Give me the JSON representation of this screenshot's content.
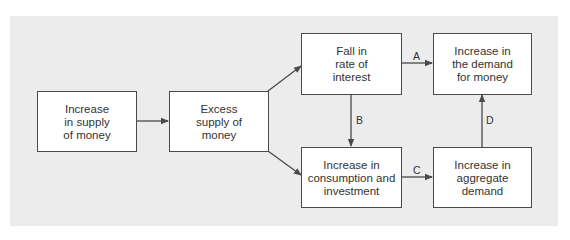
{
  "diagram": {
    "type": "flowchart",
    "colors": {
      "panel": "#ececec",
      "box_fill": "#ffffff",
      "stroke": "#4a4a4a",
      "text": "#333333"
    },
    "nodes": [
      {
        "id": "n1",
        "lines": [
          "Increase",
          "in supply",
          "of money"
        ]
      },
      {
        "id": "n2",
        "lines": [
          "Excess",
          "supply of",
          "money"
        ]
      },
      {
        "id": "n3",
        "lines": [
          "Fall in",
          "rate of",
          "interest"
        ]
      },
      {
        "id": "n4",
        "lines": [
          "Increase in",
          "the demand",
          "for money"
        ]
      },
      {
        "id": "n5",
        "lines": [
          "Increase in",
          "consumption and",
          "investment"
        ]
      },
      {
        "id": "n6",
        "lines": [
          "Increase in",
          "aggregate",
          "demand"
        ]
      }
    ],
    "edges": [
      {
        "from": "n1",
        "to": "n2",
        "label": ""
      },
      {
        "from": "n2",
        "to": "n3",
        "label": ""
      },
      {
        "from": "n2",
        "to": "n5",
        "label": ""
      },
      {
        "from": "n3",
        "to": "n4",
        "label": "A"
      },
      {
        "from": "n3",
        "to": "n5",
        "label": "B"
      },
      {
        "from": "n5",
        "to": "n6",
        "label": "C"
      },
      {
        "from": "n6",
        "to": "n4",
        "label": "D"
      }
    ]
  }
}
